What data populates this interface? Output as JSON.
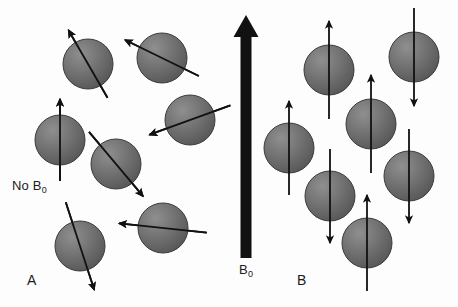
{
  "figure": {
    "width": 458,
    "height": 307,
    "background_color": "#fdfdfd"
  },
  "style": {
    "sphere_fill_light": "#8a8a8a",
    "sphere_fill_mid": "#6e6e6e",
    "sphere_fill_dark": "#545454",
    "sphere_stroke": "#3a3a3a",
    "arrow_color": "#111111",
    "arrow_width": 1.8,
    "field_arrow_color": "#111111",
    "text_color": "#1b1b1b"
  },
  "labels": {
    "no_field": {
      "text": "No B",
      "subscript": "0"
    },
    "field": {
      "text": "B",
      "subscript": "0"
    },
    "panel_a": "A",
    "panel_b": "B"
  },
  "panels": [
    {
      "id": "A",
      "letter": "A",
      "caption": "No B0",
      "description": "Randomly oriented nuclear spins in the absence of an external magnetic field",
      "field_present": false,
      "sphere_count": 7,
      "spin_orientation": "random"
    },
    {
      "id": "B",
      "letter": "B",
      "caption": "B0",
      "description": "Nuclear spins aligned parallel or antiparallel to the external magnetic field B0",
      "field_present": true,
      "sphere_count": 7,
      "spin_orientation": "aligned",
      "spins_up": 4,
      "spins_down": 3
    }
  ],
  "field_arrow": {
    "name": "B0-field-arrow",
    "direction": "up",
    "x": 246,
    "y_tail": 258,
    "y_head": 15,
    "shaft_width": 11,
    "head_width": 25,
    "head_length": 22
  },
  "chart_data": {
    "type": "diagram",
    "panel_a_spheres": [
      {
        "cx": 88,
        "cy": 64,
        "r": 25,
        "arrow_angle_deg": 240,
        "arrow_len": 78,
        "label": "random-spin-1"
      },
      {
        "cx": 162,
        "cy": 58,
        "r": 25,
        "arrow_angle_deg": 206,
        "arrow_len": 82,
        "label": "random-spin-2"
      },
      {
        "cx": 60,
        "cy": 140,
        "r": 25,
        "arrow_angle_deg": 270,
        "arrow_len": 82,
        "label": "random-spin-3"
      },
      {
        "cx": 190,
        "cy": 120,
        "r": 25,
        "arrow_angle_deg": 160,
        "arrow_len": 86,
        "label": "random-spin-4"
      },
      {
        "cx": 116,
        "cy": 164,
        "r": 25,
        "arrow_angle_deg": 50,
        "arrow_len": 84,
        "label": "random-spin-5"
      },
      {
        "cx": 80,
        "cy": 246,
        "r": 25,
        "arrow_angle_deg": 72,
        "arrow_len": 92,
        "label": "random-spin-6"
      },
      {
        "cx": 163,
        "cy": 228,
        "r": 25,
        "arrow_angle_deg": 186,
        "arrow_len": 88,
        "label": "random-spin-7"
      }
    ],
    "panel_b_spheres": [
      {
        "cx": 329,
        "cy": 70,
        "r": 25,
        "arrow_dir": "up",
        "arrow_len": 98,
        "label": "aligned-spin-up-1"
      },
      {
        "cx": 414,
        "cy": 57,
        "r": 25,
        "arrow_dir": "down",
        "arrow_len": 98,
        "label": "aligned-spin-down-1"
      },
      {
        "cx": 289,
        "cy": 148,
        "r": 25,
        "arrow_dir": "up",
        "arrow_len": 94,
        "label": "aligned-spin-up-2"
      },
      {
        "cx": 371,
        "cy": 124,
        "r": 25,
        "arrow_dir": "up",
        "arrow_len": 98,
        "label": "aligned-spin-up-3"
      },
      {
        "cx": 330,
        "cy": 196,
        "r": 25,
        "arrow_dir": "down",
        "arrow_len": 94,
        "label": "aligned-spin-down-2"
      },
      {
        "cx": 409,
        "cy": 176,
        "r": 25,
        "arrow_dir": "down",
        "arrow_len": 94,
        "label": "aligned-spin-down-3"
      },
      {
        "cx": 367,
        "cy": 243,
        "r": 25,
        "arrow_dir": "up",
        "arrow_len": 96,
        "label": "aligned-spin-up-4"
      }
    ]
  }
}
